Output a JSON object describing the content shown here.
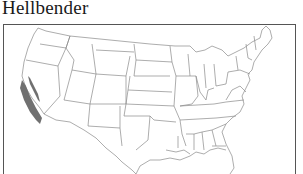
{
  "map": {
    "title": "Hellbender",
    "region": "United States (contiguous)",
    "legend": [],
    "colors": {
      "range_fill": "#707070",
      "state_border": "#8a8a8a",
      "frame": "#555555"
    },
    "highlighted_areas": [
      {
        "name": "range-coastal-california",
        "description": "shaded range along California coast"
      },
      {
        "name": "range-sierra-nevada",
        "description": "shaded inland band in California"
      }
    ]
  }
}
